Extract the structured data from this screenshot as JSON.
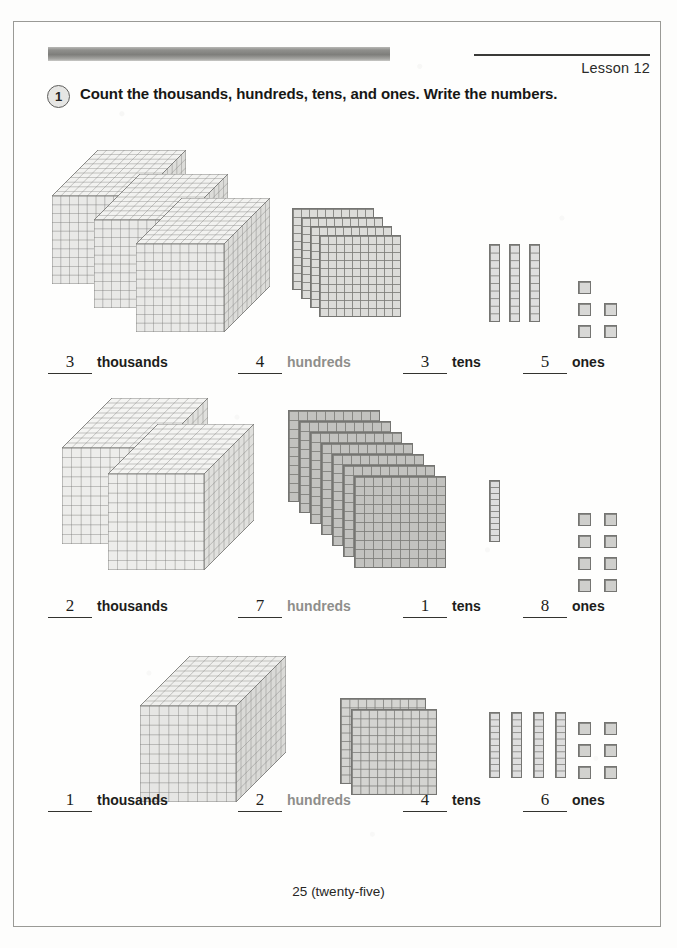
{
  "page": {
    "lesson_label": "Lesson 12",
    "problem_number": "1",
    "instruction": "Count the thousands, hundreds, tens, and ones.  Write the numbers.",
    "footer": "25 (twenty-five)"
  },
  "labels": {
    "thousands": "thousands",
    "hundreds": "hundreds",
    "tens": "tens",
    "ones": "ones"
  },
  "colors": {
    "block_light": "#e3e3e1",
    "block_mid": "#d5d5d2",
    "block_dark": "#bdbdba",
    "grid_line": "#7d7d7a",
    "ink": "#1d1d1b",
    "label_light": "#8e8e8b"
  },
  "rows": [
    {
      "id": "row-1",
      "thousands": "3",
      "hundreds": "4",
      "tens": "3",
      "ones": "5"
    },
    {
      "id": "row-2",
      "thousands": "2",
      "hundreds": "7",
      "tens": "1",
      "ones": "8"
    },
    {
      "id": "row-3",
      "thousands": "1",
      "hundreds": "2",
      "tens": "4",
      "ones": "6"
    }
  ],
  "chart_data": {
    "type": "table",
    "title": "Count the thousands, hundreds, tens, and ones. Write the numbers.",
    "categories": [
      "thousands",
      "hundreds",
      "tens",
      "ones"
    ],
    "series": [
      {
        "name": "Row 1",
        "values": [
          3,
          4,
          3,
          5
        ],
        "total": 3435
      },
      {
        "name": "Row 2",
        "values": [
          2,
          7,
          1,
          8
        ],
        "total": 2718
      },
      {
        "name": "Row 3",
        "values": [
          1,
          2,
          4,
          6
        ],
        "total": 1246
      }
    ]
  }
}
